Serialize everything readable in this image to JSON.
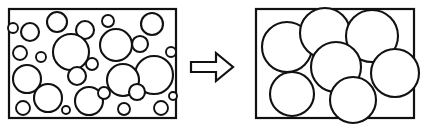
{
  "figure": {
    "background_color": "#ffffff",
    "stroke_color": "#111111",
    "fill_color": "#ffffff",
    "width": 426,
    "height": 129
  },
  "left_panel": {
    "name": "before-microstructure",
    "label": "",
    "frame": {
      "x": 9,
      "y": 9,
      "width": 167,
      "height": 109
    },
    "grain_count": 26,
    "description": "many small circles (fine grains)"
  },
  "right_panel": {
    "name": "after-microstructure",
    "label": "",
    "frame": {
      "x": 256,
      "y": 9,
      "width": 158,
      "height": 109
    },
    "grain_count": 7,
    "description": "few large circles (coarse grains)"
  },
  "arrow": {
    "name": "transformation-arrow",
    "direction": "right",
    "label": "",
    "points": "191,62 216,62 216,53 233,67 216,81 216,72 191,72"
  },
  "chart_data": {
    "type": "scatter",
    "subtitle": "",
    "xlabel": "",
    "ylabel": "",
    "grid": false,
    "legend_position": "none",
    "series": [
      {
        "name": "before",
        "panel": "left_panel",
        "units": "px",
        "circles": [
          {
            "cx": 30,
            "cy": 32,
            "r": 9
          },
          {
            "cx": 57,
            "cy": 22,
            "r": 10
          },
          {
            "cx": 85,
            "cy": 30,
            "r": 9
          },
          {
            "cx": 108,
            "cy": 21,
            "r": 6
          },
          {
            "cx": 152,
            "cy": 24,
            "r": 11
          },
          {
            "cx": 20,
            "cy": 53,
            "r": 7
          },
          {
            "cx": 41,
            "cy": 57,
            "r": 5
          },
          {
            "cx": 71,
            "cy": 52,
            "r": 18
          },
          {
            "cx": 116,
            "cy": 45,
            "r": 16
          },
          {
            "cx": 140,
            "cy": 44,
            "r": 8
          },
          {
            "cx": 92,
            "cy": 64,
            "r": 6
          },
          {
            "cx": 27,
            "cy": 79,
            "r": 14
          },
          {
            "cx": 77,
            "cy": 76,
            "r": 9
          },
          {
            "cx": 154,
            "cy": 75,
            "r": 19
          },
          {
            "cx": 123,
            "cy": 80,
            "r": 16
          },
          {
            "cx": 48,
            "cy": 98,
            "r": 14
          },
          {
            "cx": 89,
            "cy": 101,
            "r": 14
          },
          {
            "cx": 104,
            "cy": 93,
            "r": 6
          },
          {
            "cx": 137,
            "cy": 92,
            "r": 8
          },
          {
            "cx": 23,
            "cy": 108,
            "r": 7
          },
          {
            "cx": 124,
            "cy": 109,
            "r": 6
          },
          {
            "cx": 161,
            "cy": 108,
            "r": 7
          },
          {
            "cx": 171,
            "cy": 52,
            "r": 5
          },
          {
            "cx": 13,
            "cy": 28,
            "r": 5
          },
          {
            "cx": 66,
            "cy": 110,
            "r": 4
          },
          {
            "cx": 173,
            "cy": 96,
            "r": 4
          }
        ]
      },
      {
        "name": "after",
        "panel": "right_panel",
        "units": "px",
        "circles": [
          {
            "cx": 287,
            "cy": 47,
            "r": 25
          },
          {
            "cx": 325,
            "cy": 33,
            "r": 25
          },
          {
            "cx": 372,
            "cy": 36,
            "r": 26
          },
          {
            "cx": 336,
            "cy": 67,
            "r": 25
          },
          {
            "cx": 395,
            "cy": 73,
            "r": 24
          },
          {
            "cx": 292,
            "cy": 94,
            "r": 22
          },
          {
            "cx": 353,
            "cy": 100,
            "r": 23
          }
        ]
      }
    ],
    "annotations": [
      {
        "name": "transformation-arrow",
        "text": "",
        "shape": "block-arrow-right"
      }
    ]
  }
}
